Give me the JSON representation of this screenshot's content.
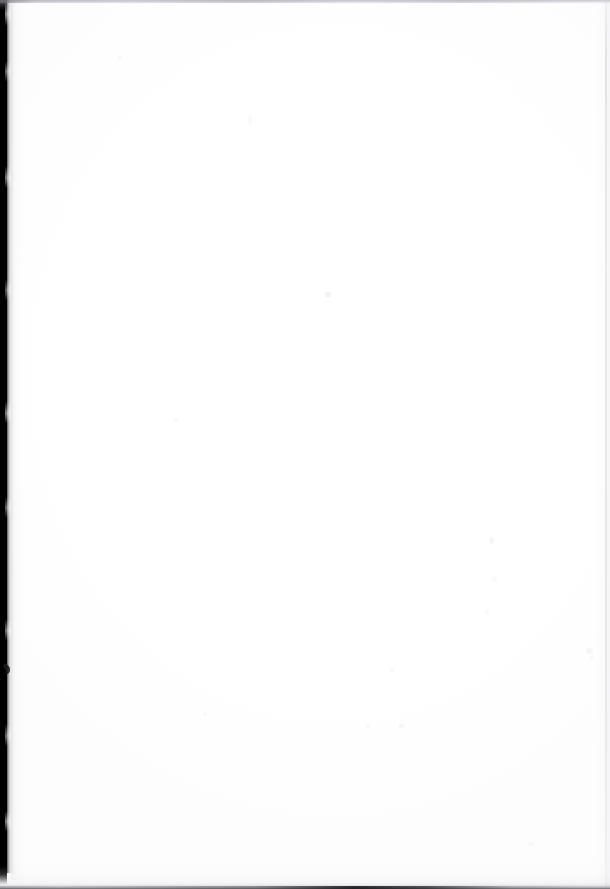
{
  "document": {
    "kind": "scanned-page",
    "description": "Blank scanned book page",
    "page_text": "",
    "width_px": 610,
    "height_px": 889
  },
  "colors": {
    "paper": "#ffffff",
    "gutter": "#000000",
    "top_edge_line": "#96969c",
    "right_edge_line": "#c4c4ca",
    "bottom_edge_shadow": "#282a2e",
    "speck": "#78788a"
  },
  "features": {
    "gutter": {
      "name": "left binding gutter",
      "label": "",
      "x_px": 0,
      "width_px": 7,
      "height_px": 871
    },
    "top_edge": {
      "name": "top page edge line",
      "label": "",
      "y_px": 0,
      "height_px": 4
    },
    "right_edge": {
      "name": "right page edge line",
      "label": "",
      "x_px": 604,
      "width_px": 2
    },
    "bottom_edge": {
      "name": "bottom page edge shadow",
      "label": "",
      "y_px": 883,
      "height_px": 6
    },
    "smudge": {
      "name": "gutter smudge mark",
      "label": "",
      "x_px": 3,
      "y_px": 663
    }
  },
  "specks": [
    {
      "x": 325,
      "y": 292,
      "w": 6,
      "h": 5,
      "tone": "s1"
    },
    {
      "x": 489,
      "y": 537,
      "w": 5,
      "h": 7,
      "tone": "s2"
    },
    {
      "x": 492,
      "y": 577,
      "w": 5,
      "h": 5,
      "tone": "s3"
    },
    {
      "x": 485,
      "y": 609,
      "w": 4,
      "h": 6,
      "tone": "s3"
    },
    {
      "x": 586,
      "y": 648,
      "w": 7,
      "h": 6,
      "tone": "s2"
    },
    {
      "x": 590,
      "y": 656,
      "w": 4,
      "h": 4,
      "tone": "s3"
    },
    {
      "x": 248,
      "y": 116,
      "w": 4,
      "h": 8,
      "tone": "s3"
    },
    {
      "x": 118,
      "y": 56,
      "w": 5,
      "h": 4,
      "tone": "s3"
    },
    {
      "x": 366,
      "y": 724,
      "w": 5,
      "h": 4,
      "tone": "s3"
    },
    {
      "x": 398,
      "y": 724,
      "w": 6,
      "h": 4,
      "tone": "s2"
    },
    {
      "x": 390,
      "y": 667,
      "w": 4,
      "h": 6,
      "tone": "s3"
    },
    {
      "x": 203,
      "y": 712,
      "w": 4,
      "h": 4,
      "tone": "s3"
    },
    {
      "x": 528,
      "y": 842,
      "w": 6,
      "h": 4,
      "tone": "s3"
    },
    {
      "x": 174,
      "y": 418,
      "w": 4,
      "h": 4,
      "tone": "s3"
    }
  ]
}
